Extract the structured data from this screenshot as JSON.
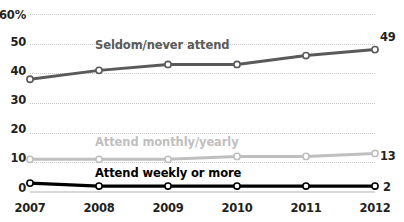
{
  "chart_data": {
    "type": "line",
    "title": "",
    "subtitle": "",
    "xlabel": "",
    "ylabel": "",
    "y_axis_unit": "%",
    "categories": [
      "2007",
      "2008",
      "2009",
      "2010",
      "2011",
      "2012"
    ],
    "ylim": [
      0,
      60
    ],
    "yticks": [
      "0",
      "10",
      "20",
      "30",
      "40",
      "50",
      "60%"
    ],
    "ytick_values": [
      0,
      10,
      20,
      30,
      40,
      50,
      60
    ],
    "grid": "horizontal-dotted",
    "legend": "inline-labels",
    "series": [
      {
        "name": "Seldom/never attend",
        "color": "#5a5a5a",
        "values": [
          38,
          41,
          43,
          43,
          46,
          48
        ],
        "end_label": "49",
        "label_x": 95,
        "label_y": 38
      },
      {
        "name": "Attend monthly/yearly",
        "color": "#bfbfbf",
        "values": [
          11,
          11,
          11,
          12,
          12,
          13
        ],
        "end_label": "13",
        "label_x": 95,
        "label_y": 135
      },
      {
        "name": "Attend weekly or more",
        "color": "#000000",
        "values": [
          3,
          2,
          2,
          2,
          2,
          2
        ],
        "end_label": "2",
        "label_x": 95,
        "label_y": 166
      }
    ]
  },
  "axis": {
    "y_ticks": [
      {
        "label": "60%",
        "value": 60
      },
      {
        "label": "50",
        "value": 50
      },
      {
        "label": "40",
        "value": 40
      },
      {
        "label": "30",
        "value": 30
      },
      {
        "label": "20",
        "value": 20
      },
      {
        "label": "10",
        "value": 10
      },
      {
        "label": "0",
        "value": 0
      }
    ],
    "x_ticks": [
      "2007",
      "2008",
      "2009",
      "2010",
      "2011",
      "2012"
    ]
  },
  "colors": {
    "dark_series": "#5a5a5a",
    "mid_series": "#bfbfbf",
    "black_series": "#000000",
    "gridline": "#c9c9c9",
    "baseline": "#d8d8d8",
    "text": "#231f20",
    "background": "#ffffff"
  }
}
